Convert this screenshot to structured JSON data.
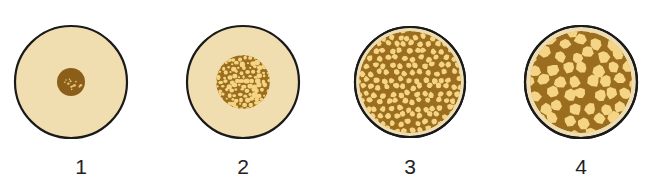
{
  "figure": {
    "colors": {
      "background": "#ffffff",
      "disc_fill": "#F0DDB0",
      "outline": "#1A1A1A",
      "core_dark": "#8B5E1A",
      "cell_wall": "#9A6E1E",
      "cell_fill": "#F5D585",
      "rim": "#EEDDB2"
    },
    "stages": [
      {
        "label": "1",
        "cx": 71,
        "cy": 82,
        "r": 56,
        "core_r": 14,
        "type": "dense-core"
      },
      {
        "label": "2",
        "cx": 243,
        "cy": 82,
        "r": 56,
        "core_r": 27,
        "type": "porous-core"
      },
      {
        "label": "3",
        "cx": 410,
        "cy": 82,
        "r": 55,
        "core_r": 51,
        "type": "fine-cellular"
      },
      {
        "label": "4",
        "cx": 581,
        "cy": 82,
        "r": 56,
        "core_r": 51,
        "type": "coarse-cellular"
      }
    ]
  }
}
